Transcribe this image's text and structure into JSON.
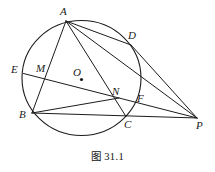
{
  "figure": {
    "caption": "图 31.1",
    "caption_label": "图",
    "caption_number": "31.1"
  },
  "style": {
    "stroke_color": "#1c1c1c",
    "background": "#ffffff",
    "label_color": "#1a1a1a",
    "circle_stroke_width": 1.1,
    "chord_stroke_width": 1.0
  },
  "canvas": {
    "width": 215,
    "height": 172
  },
  "circle": {
    "name": "main-circle",
    "center_label": "O",
    "cx": 81.5,
    "cy": 78.0,
    "rx": 59.5,
    "ry": 57.5
  },
  "points": [
    {
      "id": "A",
      "label": "A",
      "x": 66.0,
      "y": 21.0,
      "label_x": 60.0,
      "label_y": 6.0,
      "on_circle": true
    },
    {
      "id": "D",
      "label": "D",
      "x": 131.0,
      "y": 45.0,
      "label_x": 128.0,
      "label_y": 30.0,
      "on_circle": true
    },
    {
      "id": "E",
      "label": "E",
      "x": 23.5,
      "y": 73.5,
      "label_x": 11.0,
      "label_y": 64.0,
      "on_circle": true
    },
    {
      "id": "M",
      "label": "M",
      "x": 42.0,
      "y": 76.5,
      "label_x": 36.0,
      "label_y": 63.0,
      "on_circle": false
    },
    {
      "id": "O",
      "label": "O",
      "x": 81.5,
      "y": 79.5,
      "label_x": 73.0,
      "label_y": 67.0,
      "on_circle": false
    },
    {
      "id": "N",
      "label": "N",
      "x": 119.0,
      "y": 98.0,
      "label_x": 112.0,
      "label_y": 86.0,
      "on_circle": false
    },
    {
      "id": "F",
      "label": "F",
      "x": 137.0,
      "y": 102.5,
      "label_x": 137.0,
      "label_y": 93.0,
      "on_circle": true
    },
    {
      "id": "B",
      "label": "B",
      "x": 32.0,
      "y": 113.0,
      "label_x": 19.0,
      "label_y": 109.0,
      "on_circle": true
    },
    {
      "id": "C",
      "label": "C",
      "x": 126.0,
      "y": 116.5,
      "label_x": 124.0,
      "label_y": 119.0,
      "on_circle": true
    },
    {
      "id": "P",
      "label": "P",
      "x": 197.0,
      "y": 118.0,
      "label_x": 196.0,
      "label_y": 120.0,
      "on_circle": false
    }
  ],
  "segments": [
    {
      "name": "segment-A-B",
      "from": "A",
      "to": "B"
    },
    {
      "name": "segment-A-C",
      "from": "A",
      "to": "C"
    },
    {
      "name": "segment-A-D",
      "from": "A",
      "to": "D"
    },
    {
      "name": "segment-D-P",
      "from": "D",
      "to": "P"
    },
    {
      "name": "segment-E-P",
      "from": "E",
      "to": "P"
    },
    {
      "name": "segment-B-P",
      "from": "B",
      "to": "P"
    },
    {
      "name": "segment-B-N",
      "from": "B",
      "to": "N"
    },
    {
      "name": "segment-A-P",
      "from": "A",
      "to": "P"
    }
  ],
  "labels_order": [
    "A",
    "D",
    "E",
    "M",
    "O",
    "N",
    "F",
    "B",
    "C",
    "P"
  ]
}
